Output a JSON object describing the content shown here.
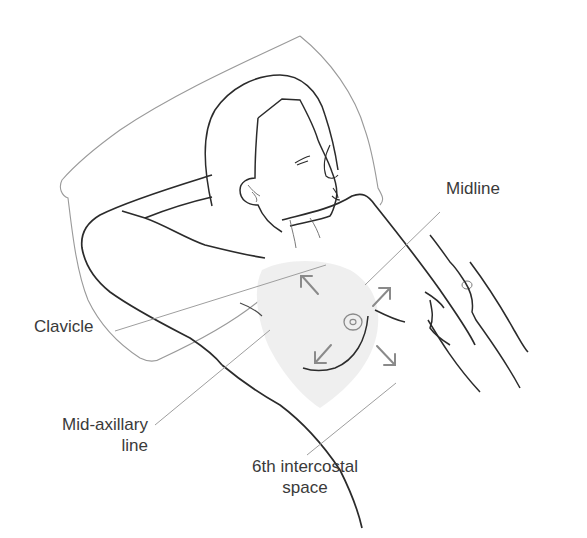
{
  "figure": {
    "colors": {
      "outline": "#2b2b2b",
      "pillow": "#9a9a9a",
      "leader_line": "#9e9e9e",
      "arrow": "#8a8a8a",
      "shaded_area": "#ececec",
      "label_text": "#3a3a3a"
    },
    "labels": {
      "midline": "Midline",
      "clavicle": "Clavicle",
      "mid_axillary_line_1": "Mid-axillary",
      "mid_axillary_line_2": "line",
      "intercostal_1": "6th intercostal",
      "intercostal_2": "space"
    },
    "icons": {
      "arrows": [
        "arrow-up-left-icon",
        "arrow-up-right-icon",
        "arrow-down-left-icon",
        "arrow-down-right-icon"
      ],
      "nipple": "nipple-areola-icon"
    }
  }
}
